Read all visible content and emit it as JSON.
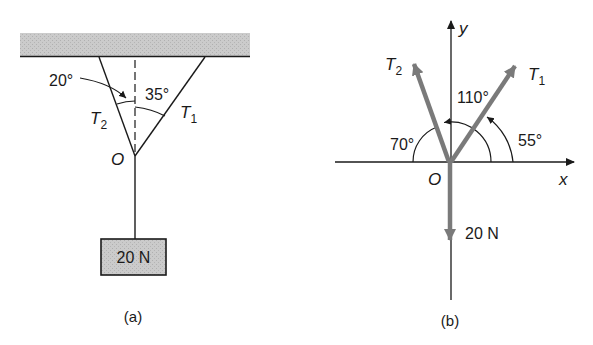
{
  "figure_a": {
    "caption": "(a)",
    "angle_left": "20°",
    "angle_right": "35°",
    "tension_left": {
      "symbol": "T",
      "subscript": "2"
    },
    "tension_right": {
      "symbol": "T",
      "subscript": "1"
    },
    "origin": "O",
    "weight": "20 N"
  },
  "figure_b": {
    "caption": "(b)",
    "axis_y": "y",
    "axis_x": "x",
    "origin": "O",
    "angle_t2_from_neg_x": "70°",
    "angle_t2_from_pos_x": "110°",
    "angle_t1_from_pos_x": "55°",
    "tension_left": {
      "symbol": "T",
      "subscript": "2"
    },
    "tension_right": {
      "symbol": "T",
      "subscript": "1"
    },
    "weight": "20 N"
  },
  "colors": {
    "ink": "#1a1a1a",
    "vector": "#7a7a7a",
    "ceiling_fill": "#c8c8c8",
    "box_fill": "#c4c4c4"
  }
}
